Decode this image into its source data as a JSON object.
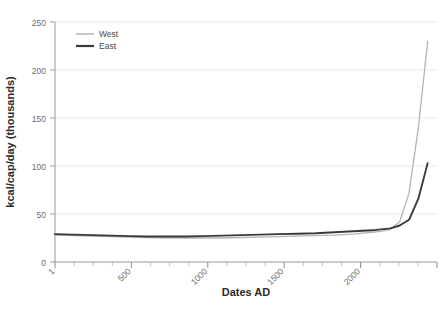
{
  "chart_data": {
    "type": "line",
    "title": "",
    "xlabel": "Dates AD",
    "ylabel": "kcal/cap/day (thousands)",
    "xlim": [
      1,
      2050
    ],
    "ylim": [
      0,
      250
    ],
    "grid": true,
    "legend_position": "top-left",
    "x_ticks_major": [
      1,
      500,
      1000,
      1500,
      2000
    ],
    "x_tick_labels": [
      "1",
      "500",
      "1000",
      "1500",
      "2000"
    ],
    "x_tick_rotation": 45,
    "y_ticks": [
      0,
      50,
      100,
      150,
      200,
      250
    ],
    "y_tick_labels": [
      "0",
      "50",
      "100",
      "150",
      "200",
      "250"
    ],
    "series": [
      {
        "name": "West",
        "color": "#b4b4b4",
        "x": [
          1,
          100,
          200,
          300,
          400,
          500,
          600,
          700,
          800,
          900,
          1000,
          1100,
          1200,
          1300,
          1400,
          1500,
          1600,
          1700,
          1750,
          1800,
          1850,
          1900,
          1950,
          2000
        ],
        "values": [
          28,
          27.5,
          27,
          26.5,
          26,
          25.5,
          25,
          25,
          25,
          25,
          25.5,
          26,
          26.5,
          27,
          27.5,
          28,
          29,
          31,
          32,
          34,
          42,
          72,
          140,
          230
        ]
      },
      {
        "name": "East",
        "color": "#3a3a3a",
        "x": [
          1,
          100,
          200,
          300,
          400,
          500,
          600,
          700,
          800,
          900,
          1000,
          1100,
          1200,
          1300,
          1400,
          1500,
          1600,
          1700,
          1750,
          1800,
          1850,
          1900,
          1950,
          2000
        ],
        "values": [
          29,
          28.5,
          28,
          27.5,
          27,
          26.5,
          26.5,
          26.5,
          27,
          27.5,
          28,
          28.5,
          29,
          29.5,
          30,
          31,
          32,
          33,
          34,
          35,
          38,
          44,
          66,
          103
        ]
      }
    ]
  },
  "legend": {
    "entries": [
      {
        "label": "West",
        "color": "#b4b4b4"
      },
      {
        "label": "East",
        "color": "#3a3a3a"
      }
    ]
  },
  "axes": {
    "x_title": "Dates AD",
    "y_title": "kcal/cap/day (thousands)"
  },
  "y_labels": {
    "t0": "0",
    "t1": "50",
    "t2": "100",
    "t3": "150",
    "t4": "200",
    "t5": "250"
  },
  "x_labels": {
    "t0": "1",
    "t1": "500",
    "t2": "1000",
    "t3": "1500",
    "t4": "2000"
  }
}
